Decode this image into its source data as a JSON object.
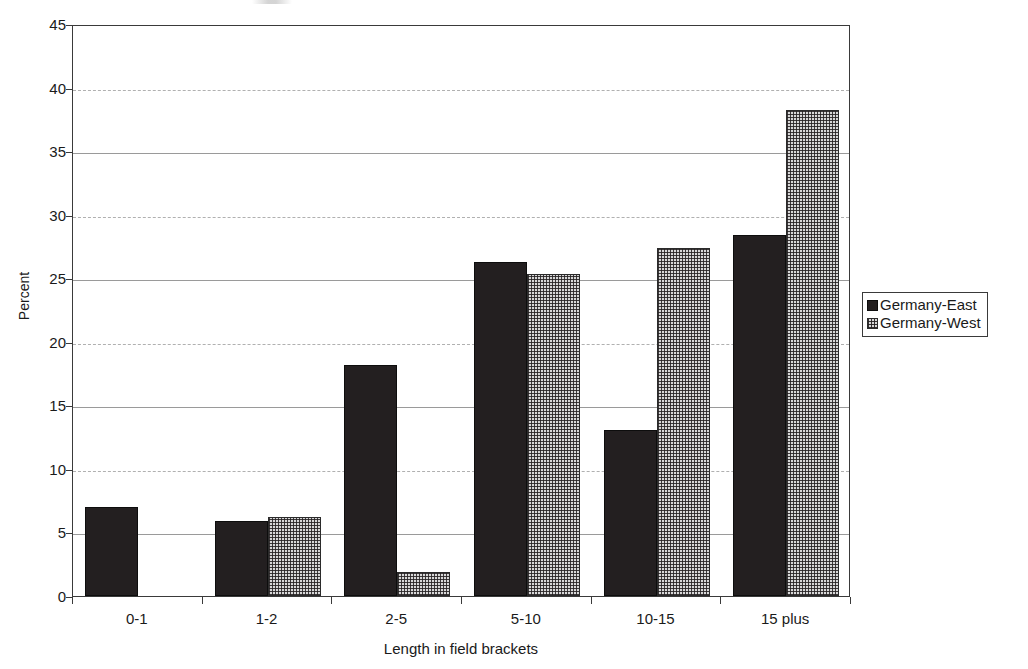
{
  "chart_data": {
    "type": "bar",
    "title": "",
    "xlabel": "Length in field brackets",
    "ylabel": "Percent",
    "categories": [
      "0-1",
      "1-2",
      "2-5",
      "5-10",
      "10-15",
      "15 plus"
    ],
    "series": [
      {
        "name": "Germany-East",
        "values": [
          7.0,
          5.9,
          18.2,
          26.3,
          13.1,
          28.4
        ]
      },
      {
        "name": "Germany-West",
        "values": [
          0.0,
          6.2,
          1.9,
          25.3,
          27.4,
          38.2
        ]
      }
    ],
    "ylim": [
      0,
      45
    ],
    "ytick_values": [
      0,
      5,
      10,
      15,
      20,
      25,
      30,
      35,
      40,
      45
    ],
    "ytick_labels": [
      "0",
      "5",
      "10",
      "15",
      "20",
      "25",
      "30",
      "35",
      "40",
      "45"
    ],
    "grid": true,
    "grid_axis": "y",
    "legend_position": "right",
    "legend": [
      {
        "label": "Germany-East",
        "pattern": "solid",
        "color": "#231f20"
      },
      {
        "label": "Germany-West",
        "pattern": "dotted-hatch",
        "color": "#d8d8d8"
      }
    ]
  }
}
